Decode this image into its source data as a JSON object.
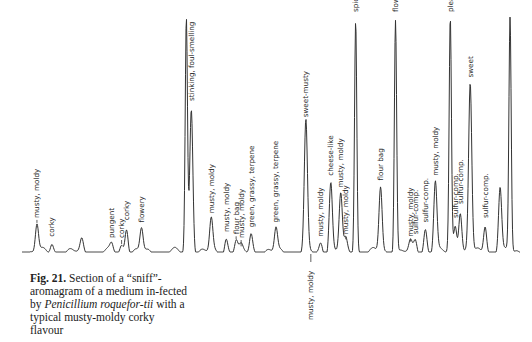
{
  "figure": {
    "label": "Fig. 21.",
    "caption_parts": {
      "p1": " Section of a “sniff”-aromagram of a medium in-fected by ",
      "italic1": "Penicillium roquefor-tii",
      "p2": " with a typical musty-moldy corky flavour"
    }
  },
  "chart_data": {
    "type": "line",
    "xlabel": "",
    "ylabel": "",
    "grid": false,
    "legend": "none",
    "note": "Gas chromatogram trace; some peaks exceed the plotted range (clipped, drawn as open tall peaks). Positions are relative retention (0-1), heights relative response (0-1).",
    "peaks": [
      {
        "x": 0.03,
        "h": 0.12,
        "label": "musty, moldy",
        "arrow": true
      },
      {
        "x": 0.06,
        "h": 0.04,
        "label": "corky"
      },
      {
        "x": 0.12,
        "h": 0.05,
        "label": ""
      },
      {
        "x": 0.18,
        "h": 0.03,
        "label": "pungent"
      },
      {
        "x": 0.2,
        "h": 0.03,
        "label": "corky",
        "arrow": true
      },
      {
        "x": 0.21,
        "h": 0.11,
        "label": "corky"
      },
      {
        "x": 0.24,
        "h": 0.1,
        "label": "flowery"
      },
      {
        "x": 0.33,
        "h": 1.0,
        "label": "",
        "clipped": true
      },
      {
        "x": 0.34,
        "h": 0.62,
        "label": "stinking, foul-smelling"
      },
      {
        "x": 0.38,
        "h": 0.14,
        "label": "musty, moldy"
      },
      {
        "x": 0.41,
        "h": 0.06,
        "label": "musty, moldy"
      },
      {
        "x": 0.43,
        "h": 0.05,
        "label": "flour bag",
        "arrow": true
      },
      {
        "x": 0.44,
        "h": 0.02,
        "label": "musty, moldy",
        "arrow": true
      },
      {
        "x": 0.46,
        "h": 0.08,
        "label": "green, grassy, terpene"
      },
      {
        "x": 0.51,
        "h": 0.1,
        "label": "green, grassy, terpene"
      },
      {
        "x": 0.57,
        "h": 0.55,
        "label": "sweet-musty"
      },
      {
        "x": 0.58,
        "h": 0.0,
        "label": "musty, moldy",
        "arrow": true,
        "below": true
      },
      {
        "x": 0.6,
        "h": 0.04,
        "label": "musty, moldy"
      },
      {
        "x": 0.62,
        "h": 0.3,
        "label": "cheese-like"
      },
      {
        "x": 0.64,
        "h": 0.25,
        "label": "musty, moldy"
      },
      {
        "x": 0.65,
        "h": 0.05,
        "label": "musty, moldy",
        "arrow": true
      },
      {
        "x": 0.67,
        "h": 1.0,
        "label": "spicy",
        "clipped": true
      },
      {
        "x": 0.72,
        "h": 0.28,
        "label": "flour bag"
      },
      {
        "x": 0.75,
        "h": 1.0,
        "label": "flowery",
        "clipped": true
      },
      {
        "x": 0.78,
        "h": 0.04,
        "label": "musty, moldy",
        "arrow": true
      },
      {
        "x": 0.79,
        "h": 0.05,
        "label": "sulfur-comp."
      },
      {
        "x": 0.81,
        "h": 0.1,
        "label": "sulfur-comp."
      },
      {
        "x": 0.83,
        "h": 0.3,
        "label": "musty, moldy"
      },
      {
        "x": 0.86,
        "h": 1.0,
        "label": "pleasant-spicy",
        "clipped": true
      },
      {
        "x": 0.87,
        "h": 0.12,
        "label": "sulfur-comp."
      },
      {
        "x": 0.88,
        "h": 0.18,
        "label": "sulfur-comp."
      },
      {
        "x": 0.9,
        "h": 0.72,
        "label": "sweet"
      },
      {
        "x": 0.93,
        "h": 0.12,
        "label": "sulfur-comp."
      },
      {
        "x": 0.96,
        "h": 0.28,
        "label": ""
      },
      {
        "x": 0.98,
        "h": 1.0,
        "label": "",
        "clipped": true
      }
    ]
  }
}
